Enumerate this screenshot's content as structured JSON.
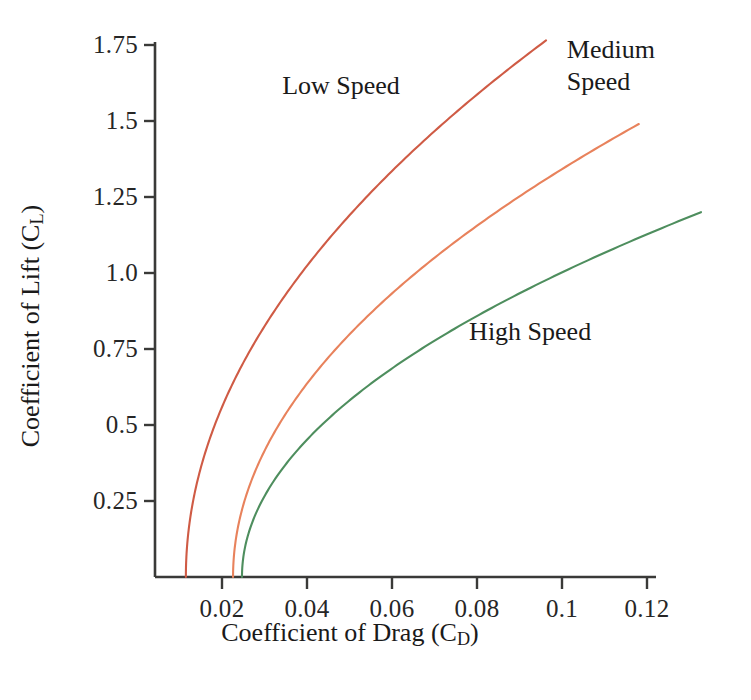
{
  "chart_data": {
    "type": "line",
    "title": "",
    "xlabel": "Coefficient of Drag (C_D)",
    "ylabel": "Coefficient of Lift (C_L)",
    "xlim": [
      0.0,
      0.132
    ],
    "ylim": [
      0.0,
      1.84
    ],
    "grid": false,
    "legend_position": "inline-annotations",
    "xticks": [
      0.02,
      0.04,
      0.06,
      0.08,
      0.1,
      0.12
    ],
    "xtick_labels": [
      "0.02",
      "0.04",
      "0.06",
      "0.08",
      "0.1",
      "0.12"
    ],
    "yticks": [
      0.25,
      0.5,
      0.75,
      1.0,
      1.25,
      1.5,
      1.75
    ],
    "ytick_labels": [
      "0.25",
      "0.5",
      "0.75",
      "1.0",
      "1.25",
      "1.5",
      "1.75"
    ],
    "series": [
      {
        "name": "Low Speed",
        "color": "#cf5b45",
        "cd0": 0.0115,
        "k": 0.0272,
        "cl_max": 1.765,
        "x": [
          0.0115,
          0.0122,
          0.0142,
          0.0176,
          0.0224,
          0.0285,
          0.036,
          0.0448,
          0.055,
          0.0665,
          0.0794,
          0.0936
        ],
        "y": [
          0.0,
          0.16,
          0.31,
          0.47,
          0.63,
          0.79,
          0.94,
          1.1,
          1.26,
          1.41,
          1.57,
          1.73
        ]
      },
      {
        "name": "Medium Speed",
        "color": "#e8825c",
        "cd0": 0.0226,
        "k": 0.043,
        "cl_max": 1.49,
        "x": [
          0.0226,
          0.0237,
          0.0269,
          0.0323,
          0.0398,
          0.0495,
          0.0613,
          0.0753,
          0.0914,
          0.1097,
          0.1183
        ],
        "y": [
          0.0,
          0.16,
          0.31,
          0.47,
          0.63,
          0.78,
          0.94,
          1.1,
          1.25,
          1.41,
          1.49
        ]
      },
      {
        "name": "High Speed",
        "color": "#4e8e5e",
        "cd0": 0.0247,
        "k": 0.075,
        "cl_max": 1.2,
        "x": [
          0.0247,
          0.0266,
          0.032,
          0.0412,
          0.0539,
          0.0703,
          0.0903,
          0.1139,
          0.1327
        ],
        "y": [
          0.0,
          0.16,
          0.31,
          0.47,
          0.63,
          0.78,
          0.94,
          1.1,
          1.2
        ]
      }
    ],
    "annotations": [
      {
        "text": "Low Speed",
        "lines": [
          "Low Speed"
        ],
        "x": 0.048,
        "y": 1.615
      },
      {
        "text": "Medium Speed",
        "lines": [
          "Medium",
          "Speed"
        ],
        "x": 0.1115,
        "y": 1.68
      },
      {
        "text": "High Speed",
        "lines": [
          "High Speed"
        ],
        "x": 0.0925,
        "y": 0.805
      }
    ]
  },
  "axes": {
    "y_title_prefix": "Coefficient of Lift (C",
    "y_title_sub": "L",
    "y_title_suffix": ")",
    "x_title_prefix": "Coefficient of Drag (C",
    "x_title_sub": "D",
    "x_title_suffix": ")"
  },
  "labels": {
    "low_speed": "Low Speed",
    "medium_speed_line1": "Medium",
    "medium_speed_line2": "Speed",
    "high_speed": "High Speed"
  },
  "colors": {
    "low_speed": "#cf5b45",
    "medium_speed": "#e8825c",
    "high_speed": "#4e8e5e",
    "axis": "#3a3a38",
    "text": "#1a1a1a",
    "background": "#ffffff"
  }
}
